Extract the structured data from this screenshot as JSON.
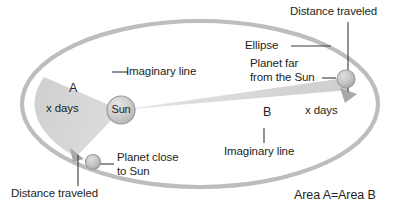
{
  "diagram": {
    "title_alt": "Kepler's second law: equal areas in equal times",
    "colors": {
      "orbit_stroke": "#b3b3b3",
      "sector_fill": "#d4d4d4",
      "sector_fill_b": "#d9d9d9",
      "sun_fill": "#c9c9c9",
      "sun_stroke": "#9a9a9a",
      "planet_fill": "#c4c4c4",
      "planet_stroke": "#9a9a9a",
      "arrow_fill": "#a8a8a8",
      "text": "#231f20",
      "leader": "#3a3a3a",
      "background": "#ffffff"
    },
    "labels": {
      "sun": "Sun",
      "area_a": "A",
      "area_a_time": "x days",
      "area_b": "B",
      "area_b_time": "x days",
      "imaginary_line_left": "Imaginary line",
      "imaginary_line_right": "Imaginary line",
      "ellipse": "Ellipse",
      "planet_far": "Planet far\nfrom the Sun",
      "planet_close": "Planet close\nto Sun",
      "distance_traveled_top": "Distance traveled",
      "distance_traveled_bottom": "Distance traveled",
      "area_equality": "Area A=Area B"
    }
  }
}
